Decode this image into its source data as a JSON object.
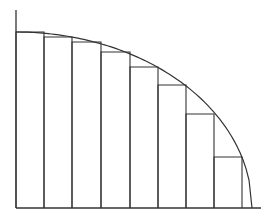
{
  "diagram": {
    "stroke_color": "#333333",
    "background": "#ffffff",
    "axes": {
      "origin": [
        16,
        208
      ],
      "y_axis_top": 10,
      "x_axis_end": 261
    },
    "curve": {
      "start": [
        16,
        32
      ],
      "end": [
        252,
        208
      ]
    },
    "rectangles": [
      {
        "x0": 16,
        "x1": 44,
        "top": 32
      },
      {
        "x0": 44,
        "x1": 72,
        "top": 37
      },
      {
        "x0": 72,
        "x1": 101,
        "top": 42
      },
      {
        "x0": 101,
        "x1": 130,
        "top": 52
      },
      {
        "x0": 130,
        "x1": 158,
        "top": 67
      },
      {
        "x0": 158,
        "x1": 186,
        "top": 85
      },
      {
        "x0": 186,
        "x1": 214,
        "top": 114
      },
      {
        "x0": 214,
        "x1": 242,
        "top": 157
      }
    ]
  }
}
